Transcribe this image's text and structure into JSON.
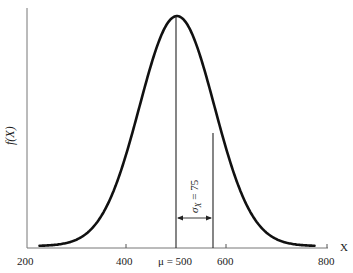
{
  "chart_data": {
    "type": "line",
    "title": "",
    "xlabel": "X",
    "ylabel": "f(X)",
    "xlim": [
      200,
      800
    ],
    "x_ticks": [
      200,
      400,
      600,
      800
    ],
    "x_tick_labels": [
      "200",
      "400",
      "600",
      "800"
    ],
    "grid": false,
    "series": [
      {
        "name": "Normal density",
        "distribution": "normal",
        "mean": 500,
        "sd": 75,
        "x": [
          225,
          250,
          275,
          300,
          325,
          350,
          375,
          400,
          425,
          450,
          475,
          500,
          525,
          550,
          575,
          600,
          625,
          650,
          675,
          700,
          725,
          750,
          775
        ],
        "y_relative": [
          0.004,
          0.004,
          0.011,
          0.029,
          0.066,
          0.135,
          0.249,
          0.411,
          0.607,
          0.801,
          0.946,
          1.0,
          0.946,
          0.801,
          0.607,
          0.411,
          0.249,
          0.135,
          0.066,
          0.029,
          0.011,
          0.004,
          0.004
        ]
      }
    ],
    "annotations": [
      {
        "type": "vline",
        "x": 500,
        "label": "μ = 500"
      },
      {
        "type": "vline",
        "x": 575
      },
      {
        "type": "double-arrow",
        "from": 500,
        "to": 575,
        "label": "σX = 75",
        "orientation": "vertical-text"
      }
    ]
  },
  "labels": {
    "y_axis": "f(X)",
    "x_axis": "X",
    "mu_label": "μ = 500",
    "sigma_symbol": "σ",
    "sigma_sub": "X",
    "sigma_value": "= 75",
    "tick_200": "200",
    "tick_400": "400",
    "tick_600": "600",
    "tick_800": "800"
  }
}
